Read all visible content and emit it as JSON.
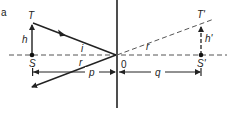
{
  "figure": {
    "panel_label": "a",
    "labels": {
      "object_top": "T",
      "object_base": "S",
      "object_height": "h",
      "incident_angle": "i",
      "reflected_angle_real": "r",
      "reflected_angle_virtual": "r",
      "origin": "0",
      "image_top": "T'",
      "image_base": "S'",
      "image_height": "h'",
      "object_distance": "p",
      "image_distance": "q"
    },
    "colors": {
      "line": "#222222",
      "background": "#ffffff"
    }
  }
}
